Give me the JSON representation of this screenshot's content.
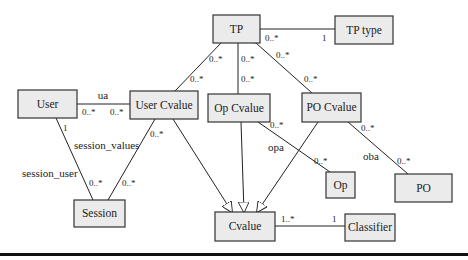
{
  "diagram": {
    "type": "UML class diagram",
    "classes": {
      "tp": "TP",
      "tp_type": "TP type",
      "user": "User",
      "user_cvalue": "User Cvalue",
      "op_cvalue": "Op Cvalue",
      "po_cvalue": "PO Cvalue",
      "session": "Session",
      "op": "Op",
      "po": "PO",
      "cvalue": "Cvalue",
      "classifier": "Classifier"
    },
    "associations": {
      "tp_tptype": {
        "from_mult": "0..*",
        "to_mult": "1"
      },
      "tp_usercvalue": {
        "from_mult": "0..*",
        "to_mult": "0..*",
        "kind": "aggregation"
      },
      "tp_opcvalue": {
        "from_mult": "0..*",
        "to_mult": "0..*",
        "kind": "aggregation"
      },
      "tp_pocvalue": {
        "from_mult": "0..*",
        "to_mult": "0..*",
        "kind": "aggregation"
      },
      "ua": {
        "label": "ua",
        "from_mult": "0..*",
        "to_mult": "0..*"
      },
      "session_user": {
        "label": "session_user",
        "from_mult": "1",
        "to_mult": "0..*"
      },
      "session_values": {
        "label": "session_values",
        "from_mult": "0..*",
        "to_mult": "0..*"
      },
      "opa": {
        "label": "opa",
        "from_mult": "0..*",
        "to_mult": "0..*"
      },
      "oba": {
        "label": "oba",
        "from_mult": "0..*",
        "to_mult": "0..*"
      },
      "cvalue_classifier": {
        "from_mult": "1..*",
        "to_mult": "1"
      }
    },
    "generalizations": [
      "User Cvalue → Cvalue",
      "Op Cvalue → Cvalue",
      "PO Cvalue → Cvalue"
    ]
  }
}
